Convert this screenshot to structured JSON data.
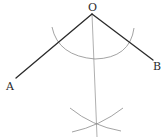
{
  "diagram": {
    "type": "geometric-construction",
    "points": {
      "O": {
        "label": "O",
        "x": 92,
        "y": 14
      },
      "A": {
        "label": "A",
        "x": 16,
        "y": 78
      },
      "B": {
        "label": "B",
        "x": 153,
        "y": 60
      }
    },
    "labels": {
      "O": "O",
      "A": "A",
      "B": "B"
    },
    "segments": [
      {
        "name": "OA",
        "from": "O",
        "to": "A"
      },
      {
        "name": "OB",
        "from": "O",
        "to": "B"
      }
    ],
    "construction": {
      "main_arc": {
        "center": "O",
        "radius": 45
      },
      "intersection_arcs_meet": {
        "x": 96,
        "y": 125
      },
      "bisector": {
        "from": "O",
        "to_x": 97,
        "to_y": 137
      }
    },
    "colors": {
      "rays": "#2b2b2b",
      "construction": "#8c8c8c",
      "background": "#ffffff"
    }
  }
}
